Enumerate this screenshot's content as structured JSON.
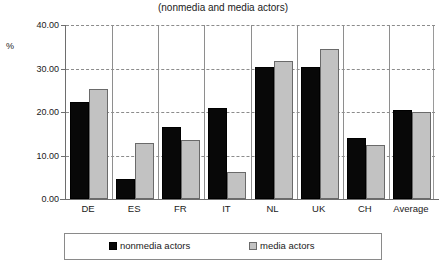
{
  "chart_data": {
    "type": "bar",
    "title": "(nonmedia and media actors)",
    "xlabel": "",
    "ylabel": "%",
    "ylim": [
      0,
      40
    ],
    "ytick_step": 10,
    "ytick_labels": [
      "0.00",
      "10.00",
      "20.00",
      "30.00",
      "40.00"
    ],
    "grid": true,
    "legend_position": "bottom",
    "categories": [
      "DE",
      "ES",
      "FR",
      "IT",
      "NL",
      "UK",
      "CH",
      "Average"
    ],
    "series": [
      {
        "name": "nonmedia actors",
        "color": "#080808",
        "values": [
          22.3,
          4.6,
          16.6,
          21.0,
          30.3,
          30.4,
          14.1,
          20.4
        ]
      },
      {
        "name": "media actors",
        "color": "#c2c2c2",
        "values": [
          25.3,
          12.8,
          13.6,
          6.2,
          31.8,
          34.5,
          12.4,
          19.9
        ]
      }
    ]
  },
  "legend": {
    "entries": [
      {
        "label": "nonmedia actors"
      },
      {
        "label": "media actors"
      }
    ]
  }
}
